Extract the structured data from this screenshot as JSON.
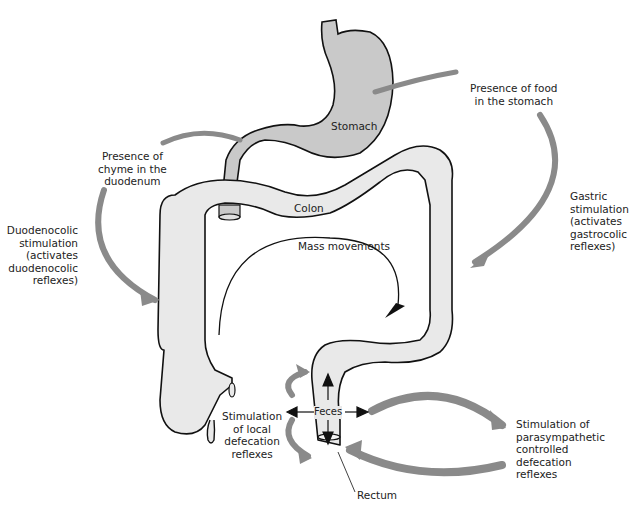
{
  "diagram": {
    "type": "anatomical-flow",
    "colors": {
      "stomach_fill": "#c9c9c9",
      "colon_fill": "#e9e9e9",
      "outline": "#111111",
      "reflex_arrow": "#8a8a8a",
      "text": "#222222"
    },
    "organs": {
      "stomach": "Stomach",
      "colon": "Colon",
      "rectum": "Rectum",
      "feces": "Feces"
    },
    "labels": {
      "mass_movements": "Mass movements",
      "food_in_stomach": [
        "Presence of food",
        "in the stomach"
      ],
      "chyme_duodenum": [
        "Presence of",
        "chyme in the",
        "duodenum"
      ],
      "gastric_stimulation": [
        "Gastric",
        "stimulation",
        "(activates",
        "gastrocolic",
        "reflexes)"
      ],
      "duodenocolic_stimulation": [
        "Duodenocolic",
        "stimulation",
        "(activates",
        "duodenocolic",
        "reflexes)"
      ],
      "local_defecation": [
        "Stimulation",
        "of local",
        "defecation",
        "reflexes"
      ],
      "parasympathetic": [
        "Stimulation of",
        "parasympathetic",
        "controlled",
        "defecation",
        "reflexes"
      ]
    }
  }
}
